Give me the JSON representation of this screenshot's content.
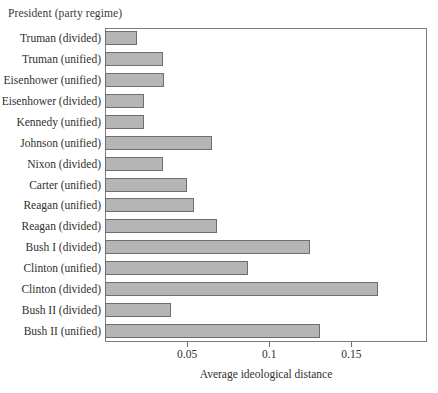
{
  "chart_data": {
    "type": "bar",
    "orientation": "horizontal",
    "title": "",
    "group_title": "President (party regime)",
    "xlabel": "Average ideological distance",
    "ylabel": "",
    "xlim": [
      0,
      0.196
    ],
    "xticks": [
      0.05,
      0.1,
      0.15
    ],
    "xtick_labels": [
      "0.05",
      "0.1",
      "0.15"
    ],
    "grid": false,
    "legend": null,
    "bar_fill": "#b5b5b5",
    "bar_border": "#6e6e6e",
    "categories": [
      "Truman (divided)",
      "Truman (unified)",
      "Eisenhower (unified)",
      "Eisenhower (divided)",
      "Kennedy (unified)",
      "Johnson (unified)",
      "Nixon (divided)",
      "Carter (unified)",
      "Reagan (unified)",
      "Reagan (divided)",
      "Bush I (divided)",
      "Clinton (unified)",
      "Clinton (divided)",
      "Bush II (divided)",
      "Bush II (unified)"
    ],
    "values": [
      0.0195,
      0.035,
      0.036,
      0.024,
      0.024,
      0.065,
      0.035,
      0.05,
      0.054,
      0.068,
      0.125,
      0.087,
      0.166,
      0.04,
      0.131
    ]
  }
}
